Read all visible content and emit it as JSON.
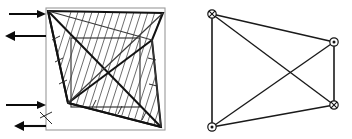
{
  "figure": {
    "background_color": "#ffffff",
    "width": 352,
    "height": 139
  },
  "left_panel": {
    "name": "deformed-plate-panel",
    "outer_square": {
      "label": "undeformed boundary",
      "x": 46,
      "y": 8,
      "width": 119,
      "height": 122,
      "color": "#9a9a9a"
    },
    "inner_rectangle": {
      "label": "reference grid rectangle",
      "x": 71,
      "y": 38,
      "width": 69,
      "height": 69,
      "color": "#3a3a3a"
    },
    "deformed_quad": {
      "label": "deformed shape",
      "color": "#121212",
      "points": [
        {
          "name": "top-left-vertex",
          "x": 48,
          "y": 11
        },
        {
          "name": "top-right-vertex",
          "x": 163,
          "y": 13
        },
        {
          "name": "right-inner-vertex",
          "x": 152,
          "y": 40
        },
        {
          "name": "bottom-right-vertex",
          "x": 161,
          "y": 127
        },
        {
          "name": "left-inner-vertex",
          "x": 68,
          "y": 103
        }
      ]
    },
    "diagonals": {
      "label": "internal diagonal members",
      "color": "#121212"
    },
    "hatching": {
      "label": "hatched deformation band",
      "angle_degrees": 70,
      "spacing": 7,
      "color": "#5c5c5c"
    },
    "arrows": [
      {
        "name": "load-arrow-1",
        "direction": "right",
        "y": 14,
        "x_start": 9,
        "x_end": 46,
        "label": "inward load top"
      },
      {
        "name": "load-arrow-2",
        "direction": "left",
        "y": 36,
        "x_start": 46,
        "x_end": 5,
        "label": "outward load upper"
      },
      {
        "name": "load-arrow-3",
        "direction": "right",
        "y": 105,
        "x_start": 6,
        "x_end": 46,
        "label": "inward load lower"
      },
      {
        "name": "load-arrow-4",
        "direction": "left",
        "y": 126,
        "x_start": 46,
        "x_end": 14,
        "label": "outward load bottom"
      }
    ]
  },
  "right_panel": {
    "name": "support-quadrilateral-panel",
    "quad": {
      "label": "support quadrilateral",
      "color": "#1a1a1a",
      "points": [
        {
          "name": "top-left-node",
          "x": 212,
          "y": 14
        },
        {
          "name": "top-right-node",
          "x": 334,
          "y": 42
        },
        {
          "name": "bottom-right-node",
          "x": 334,
          "y": 105
        },
        {
          "name": "bottom-left-node",
          "x": 212,
          "y": 127
        }
      ]
    },
    "diagonals": {
      "label": "cross diagonals",
      "color": "#1a1a1a"
    },
    "markers": [
      {
        "name": "marker-top-left",
        "symbol": "crossed-circle",
        "glyph": "⊗",
        "x": 212,
        "y": 14,
        "label": "fixed support"
      },
      {
        "name": "marker-top-right",
        "symbol": "dotted-circle",
        "glyph": "⊙",
        "x": 334,
        "y": 42,
        "label": "pinned support"
      },
      {
        "name": "marker-bottom-right",
        "symbol": "crossed-circle",
        "glyph": "⊗",
        "x": 334,
        "y": 105,
        "label": "fixed support"
      },
      {
        "name": "marker-bottom-left",
        "symbol": "dotted-circle",
        "glyph": "⊙",
        "x": 212,
        "y": 127,
        "label": "pinned support"
      }
    ]
  }
}
